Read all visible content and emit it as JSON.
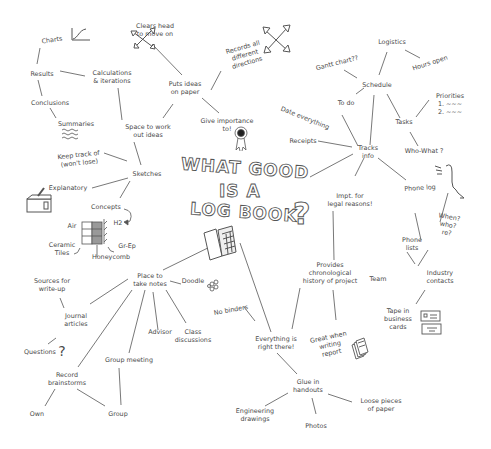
{
  "title": {
    "line1": "WHAT GOOD",
    "line2": "IS A",
    "line3": "LOG BOOK",
    "question_mark": "?"
  },
  "nodes": {
    "charts": "Charts",
    "results": "Results",
    "conclusions": "Conclusions",
    "summaries": "Summaries",
    "calculations": "Calculations\n& iterations",
    "space_to_work": "Space to work\nout ideas",
    "clears_head": "Clears head\nto move on",
    "puts_ideas": "Puts ideas\non paper",
    "records_all": "Records all\ndifferent\ndirections",
    "give_importance": "Give importance\nto!",
    "keep_track": "Keep track of\n(won't lose)",
    "sketches": "Sketches",
    "explanatory": "Explanatory",
    "concepts": "Concepts",
    "h2": "H2",
    "air": "Air",
    "ceramic_tiles": "Ceramic\nTiles",
    "honeycomb": "Honeycomb",
    "gr_ep": "Gr-Ep",
    "logistics": "Logistics",
    "gantt": "Gantt chart??",
    "hours_open": "Hours open",
    "schedule": "Schedule",
    "to_do": "To do",
    "date_everything": "Date everything",
    "tasks": "Tasks",
    "priorities": "Priorities\n1. ~~~\n2. ~~~",
    "who_what": "Who-What ?",
    "receipts": "Receipts",
    "tracks_info": "Tracks\ninfo",
    "impt_legal": "Impt. for\nlegal reasons!",
    "phone_log": "Phone log",
    "when_who_re": "When?\nwho?\nre?",
    "phone_lists": "Phone\nlists",
    "team": "Team",
    "industry_contacts": "Industry\ncontacts",
    "tape_business_cards": "Tape in\nbusiness\ncards",
    "provides_history": "Provides\nchronological\nhistory of project",
    "great_when_writing": "Great when\nwriting\nreport",
    "sources_writeup": "Sources for\nwrite-up",
    "journal_articles": "Journal\narticles",
    "questions": "Questions",
    "place_to_take_notes": "Place to\ntake notes",
    "doodle": "Doodle",
    "advisor": "Advisor",
    "class_discussions": "Class\ndiscussions",
    "group_meeting": "Group meeting",
    "record_brainstorms": "Record\nbrainstorms",
    "own": "Own",
    "group": "Group",
    "no_binders": "No binders",
    "everything_right_there": "Everything is\nright there!",
    "glue_handouts": "Glue in\nhandouts",
    "engineering_drawings": "Engineering\ndrawings",
    "photos": "Photos",
    "loose_pieces": "Loose pieces\nof paper"
  },
  "colors": {
    "line": "#555555",
    "text": "#4a4a4a",
    "background": "#ffffff"
  }
}
